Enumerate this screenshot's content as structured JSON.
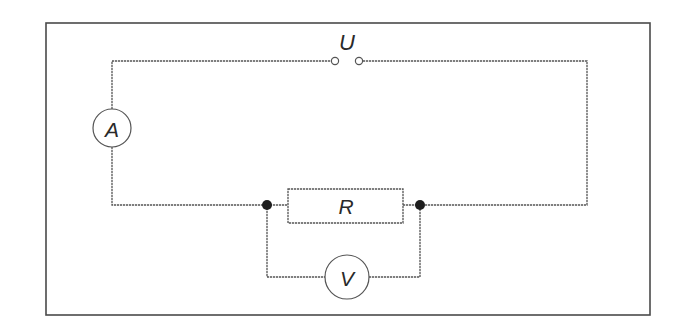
{
  "diagram": {
    "type": "electrical-circuit",
    "colors": {
      "background": "#ffffff",
      "line": "#555555",
      "frame": "#4a4a4a",
      "junction": "#1e1e1e",
      "text": "#2a2a2a"
    },
    "labels": {
      "source": "U",
      "ammeter": "A",
      "resistor": "R",
      "voltmeter": "V"
    },
    "components": [
      {
        "id": "source",
        "kind": "voltage-source-terminals",
        "label": "U"
      },
      {
        "id": "ammeter",
        "kind": "ammeter",
        "label": "A",
        "connection": "series"
      },
      {
        "id": "resistor",
        "kind": "resistor",
        "label": "R"
      },
      {
        "id": "voltmeter",
        "kind": "voltmeter",
        "label": "V",
        "connection": "parallel-to-R"
      }
    ],
    "junctions": 2
  }
}
